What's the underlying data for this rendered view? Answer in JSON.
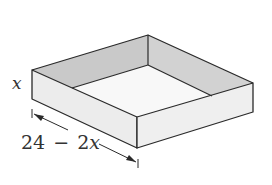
{
  "diagram": {
    "height_label": "x",
    "side_label_number": "24",
    "side_label_minus": "−",
    "side_label_coeff": "2",
    "side_label_var": "x",
    "side_label_full": "24 − 2x",
    "colors": {
      "stroke": "#2a2a2a",
      "inner_wall": "#c9c9c9",
      "inner_wall_right": "#d2d2d2",
      "floor": "#f8f8f8",
      "outer_left_face": "#ececec",
      "outer_right_face": "#efefef",
      "label": "#333333"
    }
  }
}
